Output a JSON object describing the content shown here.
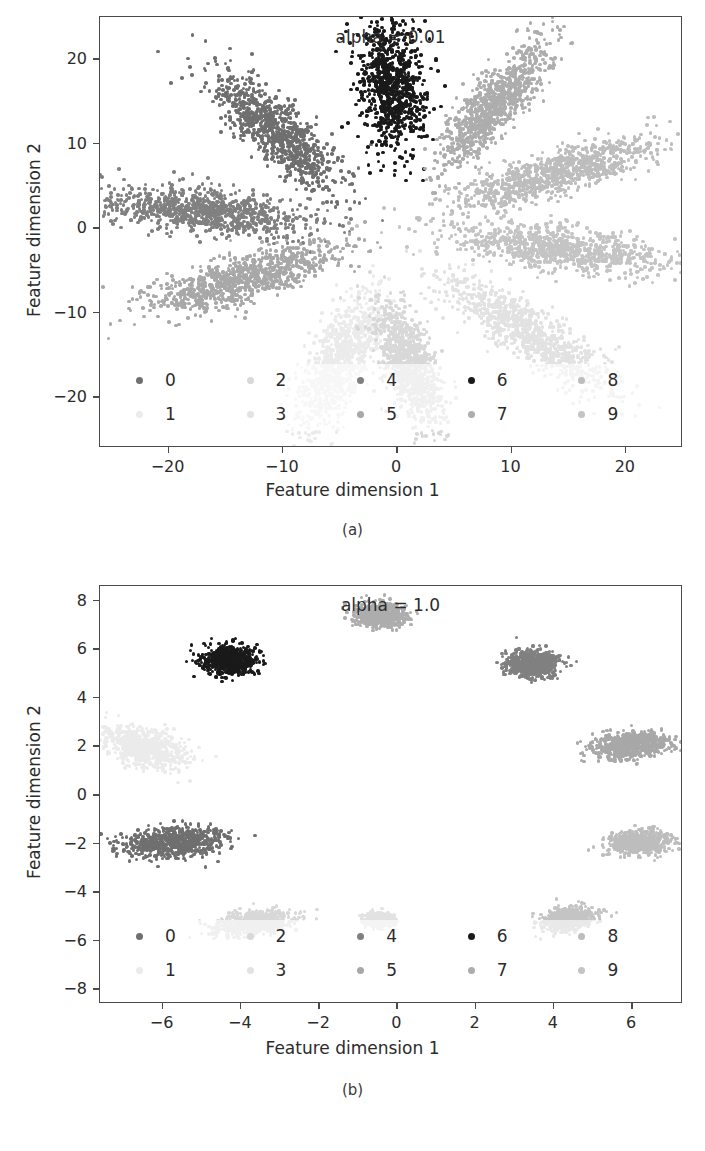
{
  "figure": {
    "panels": [
      {
        "id": "a",
        "caption": "(a)",
        "title": "alpha = 0.01",
        "xlabel": "Feature dimension 1",
        "ylabel": "Feature dimension 2"
      },
      {
        "id": "b",
        "caption": "(b)",
        "title": "alpha = 1.0",
        "xlabel": "Feature dimension 1",
        "ylabel": "Feature dimension 2"
      }
    ]
  },
  "legend": {
    "labels": [
      "0",
      "1",
      "2",
      "3",
      "4",
      "5",
      "6",
      "7",
      "8",
      "9"
    ],
    "colors": [
      "#6f6f6f",
      "#ebebeb",
      "#d8d8d8",
      "#e2e2e2",
      "#808080",
      "#a8a8a8",
      "#1a1a1a",
      "#adadad",
      "#bdbdbd",
      "#c4c4c4"
    ]
  },
  "chart_data": [
    {
      "type": "scatter",
      "title": "alpha = 0.01",
      "xlabel": "Feature dimension 1",
      "ylabel": "Feature dimension 2",
      "xlim": [
        -26,
        25
      ],
      "ylim": [
        -26,
        25
      ],
      "xticks": [
        -20,
        -10,
        0,
        10,
        20
      ],
      "yticks": [
        -20,
        -10,
        0,
        10,
        20
      ],
      "grid": false,
      "legend_position": "lower center",
      "series": [
        {
          "name": "0",
          "color": "#6f6f6f",
          "n": 900,
          "cx": -10.5,
          "cy": 11.5,
          "angle_deg": 128,
          "len": 11.0,
          "wid": 3.4,
          "size": 3.6
        },
        {
          "name": "1",
          "color": "#ebebeb",
          "n": 900,
          "cx": -5.0,
          "cy": -15.5,
          "angle_deg": 250,
          "len": 11.0,
          "wid": 3.4,
          "size": 3.6
        },
        {
          "name": "2",
          "color": "#d8d8d8",
          "n": 900,
          "cx": 1.0,
          "cy": -16.0,
          "angle_deg": 285,
          "len": 10.0,
          "wid": 3.0,
          "size": 3.6
        },
        {
          "name": "3",
          "color": "#e2e2e2",
          "n": 900,
          "cx": 11.5,
          "cy": -12.5,
          "angle_deg": 318,
          "len": 12.5,
          "wid": 3.4,
          "size": 3.6
        },
        {
          "name": "4",
          "color": "#808080",
          "n": 900,
          "cx": -17.0,
          "cy": 2.0,
          "angle_deg": 172,
          "len": 12.5,
          "wid": 3.4,
          "size": 3.6
        },
        {
          "name": "5",
          "color": "#a8a8a8",
          "n": 900,
          "cx": -13.5,
          "cy": -6.0,
          "angle_deg": 202,
          "len": 12.0,
          "wid": 3.4,
          "size": 3.6
        },
        {
          "name": "6",
          "color": "#1a1a1a",
          "n": 900,
          "cx": -0.5,
          "cy": 17.0,
          "angle_deg": 95,
          "len": 10.0,
          "wid": 3.6,
          "size": 3.6
        },
        {
          "name": "7",
          "color": "#adadad",
          "n": 900,
          "cx": 8.5,
          "cy": 14.5,
          "angle_deg": 60,
          "len": 11.0,
          "wid": 3.2,
          "size": 3.6
        },
        {
          "name": "8",
          "color": "#bdbdbd",
          "n": 900,
          "cx": 14.0,
          "cy": 6.5,
          "angle_deg": 22,
          "len": 12.5,
          "wid": 3.2,
          "size": 3.6
        },
        {
          "name": "9",
          "color": "#c4c4c4",
          "n": 900,
          "cx": 14.5,
          "cy": -2.5,
          "angle_deg": 350,
          "len": 13.0,
          "wid": 3.2,
          "size": 3.6
        }
      ]
    },
    {
      "type": "scatter",
      "title": "alpha = 1.0",
      "xlabel": "Feature dimension 1",
      "ylabel": "Feature dimension 2",
      "xlim": [
        -7.6,
        7.3
      ],
      "ylim": [
        -8.6,
        8.6
      ],
      "xticks": [
        -6,
        -4,
        -2,
        0,
        2,
        4,
        6
      ],
      "yticks": [
        -8,
        -6,
        -4,
        -2,
        0,
        2,
        4,
        6,
        8
      ],
      "grid": false,
      "legend_position": "lower center",
      "series": [
        {
          "name": "0",
          "color": "#6f6f6f",
          "n": 700,
          "cx": -5.7,
          "cy": -1.95,
          "angle_deg": 8,
          "len": 1.7,
          "wid": 0.75,
          "size": 3.4
        },
        {
          "name": "1",
          "color": "#ebebeb",
          "n": 700,
          "cx": -6.45,
          "cy": 1.95,
          "angle_deg": 330,
          "len": 1.5,
          "wid": 0.9,
          "size": 3.4
        },
        {
          "name": "2",
          "color": "#d8d8d8",
          "n": 700,
          "cx": -3.65,
          "cy": -5.25,
          "angle_deg": 15,
          "len": 1.3,
          "wid": 0.6,
          "size": 3.4
        },
        {
          "name": "3",
          "color": "#e2e2e2",
          "n": 700,
          "cx": -0.45,
          "cy": -5.15,
          "angle_deg": 0,
          "len": 0.45,
          "wid": 0.35,
          "size": 3.4
        },
        {
          "name": "4",
          "color": "#808080",
          "n": 700,
          "cx": 3.45,
          "cy": 5.4,
          "angle_deg": 0,
          "len": 0.85,
          "wid": 0.7,
          "size": 3.4
        },
        {
          "name": "5",
          "color": "#a8a8a8",
          "n": 700,
          "cx": 5.95,
          "cy": 2.05,
          "angle_deg": 8,
          "len": 1.3,
          "wid": 0.65,
          "size": 3.4
        },
        {
          "name": "6",
          "color": "#1a1a1a",
          "n": 700,
          "cx": -4.3,
          "cy": 5.55,
          "angle_deg": 0,
          "len": 0.9,
          "wid": 0.7,
          "size": 3.4
        },
        {
          "name": "7",
          "color": "#adadad",
          "n": 700,
          "cx": -0.45,
          "cy": 7.4,
          "angle_deg": 0,
          "len": 0.85,
          "wid": 0.65,
          "size": 3.4
        },
        {
          "name": "8",
          "color": "#bdbdbd",
          "n": 700,
          "cx": 6.2,
          "cy": -1.95,
          "angle_deg": 5,
          "len": 0.95,
          "wid": 0.6,
          "size": 3.4
        },
        {
          "name": "9",
          "color": "#c4c4c4",
          "n": 700,
          "cx": 4.35,
          "cy": -5.1,
          "angle_deg": 20,
          "len": 0.9,
          "wid": 0.55,
          "size": 3.4
        }
      ]
    }
  ]
}
